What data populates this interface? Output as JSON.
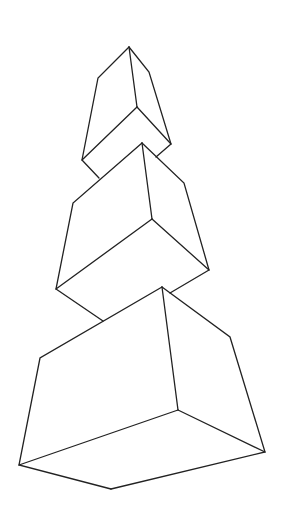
{
  "figure": {
    "description": "Line drawing of three stacked rectangular boxes in perspective, tilted, increasing in size from top to bottom",
    "background": "#ffffff",
    "stroke_color": "#222222",
    "boxes": [
      {
        "name": "top-box",
        "vertices": {
          "top": [
            129,
            47
          ],
          "left_shoulder": [
            98,
            78
          ],
          "right_shoulder": [
            149,
            72
          ],
          "inner": [
            137,
            107
          ],
          "left_bottom": [
            82,
            160
          ],
          "right_bottom": [
            171,
            144
          ],
          "bottom_left_hidden": [
            99,
            178
          ],
          "bottom_right_hidden": [
            156,
            157
          ]
        }
      },
      {
        "name": "middle-box",
        "vertices": {
          "top": [
            142,
            143
          ],
          "left_shoulder": [
            73,
            203
          ],
          "right_shoulder": [
            184,
            183
          ],
          "inner": [
            152,
            219
          ],
          "left_bottom": [
            56,
            289
          ],
          "right_bottom": [
            209,
            270
          ],
          "bottom_left_hidden": [
            103,
            321
          ],
          "bottom_right_hidden": [
            170,
            293
          ]
        }
      },
      {
        "name": "bottom-box",
        "vertices": {
          "top": [
            162,
            287
          ],
          "left_shoulder": [
            40,
            358
          ],
          "right_shoulder": [
            230,
            337
          ],
          "inner": [
            178,
            410
          ],
          "left_bottom": [
            19,
            465
          ],
          "right_bottom": [
            265,
            452
          ],
          "bottom": [
            111,
            489
          ]
        }
      }
    ]
  }
}
